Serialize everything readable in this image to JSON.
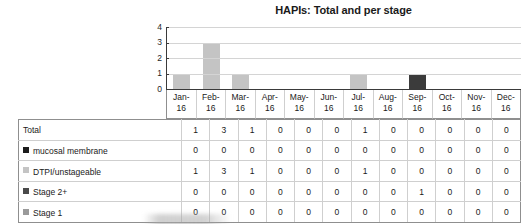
{
  "chart_data": {
    "type": "bar",
    "title": "HAPIs: Total and per stage",
    "xlabel": "",
    "ylabel": "",
    "ylim": [
      0,
      4
    ],
    "yticks": [
      "0",
      "1",
      "2",
      "3",
      "4"
    ],
    "grid": true,
    "legend_position": "table-row-labels",
    "categories": [
      "Jan-16",
      "Feb-16",
      "Mar-16",
      "Apr-16",
      "May-16",
      "Jun-16",
      "Jul-16",
      "Aug-16",
      "Sep-16",
      "Oct-16",
      "Nov-16",
      "Dec-16"
    ],
    "category_lines": [
      [
        "Jan-",
        "16"
      ],
      [
        "Feb-",
        "16"
      ],
      [
        "Mar-",
        "16"
      ],
      [
        "Apr-",
        "16"
      ],
      [
        "May-",
        "16"
      ],
      [
        "Jun-",
        "16"
      ],
      [
        "Jul-",
        "16"
      ],
      [
        "Aug-",
        "16"
      ],
      [
        "Sep-",
        "16"
      ],
      [
        "Oct-",
        "16"
      ],
      [
        "Nov-",
        "16"
      ],
      [
        "Dec-",
        "16"
      ]
    ],
    "values": [
      1,
      3,
      1,
      0,
      0,
      0,
      1,
      0,
      1,
      0,
      0,
      0
    ],
    "bar_colors": [
      "#c4c4c4",
      "#c4c4c4",
      "#c4c4c4",
      "#c4c4c4",
      "#c4c4c4",
      "#c4c4c4",
      "#c4c4c4",
      "#c4c4c4",
      "#3b3b3b",
      "#c4c4c4",
      "#c4c4c4",
      "#c4c4c4"
    ],
    "series": [
      {
        "name": "Total",
        "values": [
          1,
          3,
          1,
          0,
          0,
          0,
          1,
          0,
          0,
          0,
          0,
          0
        ],
        "color": "#ffffff"
      },
      {
        "name": "mucosal membrane",
        "values": [
          0,
          0,
          0,
          0,
          0,
          0,
          0,
          0,
          0,
          0,
          0,
          0
        ],
        "color": "#1c1c1c"
      },
      {
        "name": "DTPI/unstageable",
        "values": [
          1,
          3,
          1,
          0,
          0,
          0,
          1,
          0,
          0,
          0,
          0,
          0
        ],
        "color": "#c4c4c4"
      },
      {
        "name": "Stage 2+",
        "values": [
          0,
          0,
          0,
          0,
          0,
          0,
          0,
          0,
          1,
          0,
          0,
          0
        ],
        "color": "#4a4a4a"
      },
      {
        "name": "Stage 1",
        "values": [
          0,
          0,
          0,
          0,
          0,
          0,
          0,
          0,
          0,
          0,
          0,
          0
        ],
        "color": "#9a9a9a"
      }
    ]
  },
  "table": {
    "rows": [
      {
        "label": "Total",
        "has_swatch": false,
        "swatch_color": "",
        "values": [
          "1",
          "3",
          "1",
          "0",
          "0",
          "0",
          "1",
          "0",
          "0",
          "0",
          "0",
          "0"
        ]
      },
      {
        "label": "mucosal membrane",
        "has_swatch": true,
        "swatch_color": "#1c1c1c",
        "values": [
          "0",
          "0",
          "0",
          "0",
          "0",
          "0",
          "0",
          "0",
          "0",
          "0",
          "0",
          "0"
        ]
      },
      {
        "label": "DTPI/unstageable",
        "has_swatch": true,
        "swatch_color": "#c4c4c4",
        "values": [
          "1",
          "3",
          "1",
          "0",
          "0",
          "0",
          "1",
          "0",
          "0",
          "0",
          "0",
          "0"
        ]
      },
      {
        "label": "Stage 2+",
        "has_swatch": true,
        "swatch_color": "#4a4a4a",
        "values": [
          "0",
          "0",
          "0",
          "0",
          "0",
          "0",
          "0",
          "0",
          "1",
          "0",
          "0",
          "0"
        ]
      },
      {
        "label": "Stage 1",
        "has_swatch": true,
        "swatch_color": "#9a9a9a",
        "values": [
          "0",
          "0",
          "0",
          "0",
          "0",
          "0",
          "0",
          "0",
          "0",
          "0",
          "0",
          "0"
        ]
      }
    ]
  },
  "colors": {
    "bar_light": "#c4c4c4",
    "bar_dark": "#3b3b3b",
    "axis": "#3a3a3a",
    "gridline": "#d4d4d4",
    "table_border": "#cfcfcf",
    "table_outer_border": "#8f8f8f",
    "text": "#1a1a1a"
  }
}
